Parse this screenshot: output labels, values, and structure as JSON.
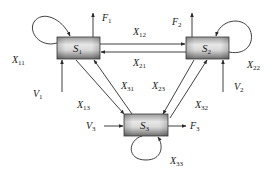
{
  "diagram": {
    "type": "flow-network",
    "nodes": [
      {
        "id": "S1",
        "label": "S",
        "sub": "1"
      },
      {
        "id": "S2",
        "label": "S",
        "sub": "2"
      },
      {
        "id": "S3",
        "label": "S",
        "sub": "3"
      }
    ],
    "edges": [
      {
        "id": "X11",
        "label": "X",
        "sub": "11",
        "from": "S1",
        "to": "S1"
      },
      {
        "id": "X22",
        "label": "X",
        "sub": "22",
        "from": "S2",
        "to": "S2"
      },
      {
        "id": "X33",
        "label": "X",
        "sub": "33",
        "from": "S3",
        "to": "S3"
      },
      {
        "id": "X12",
        "label": "X",
        "sub": "12",
        "from": "S1",
        "to": "S2"
      },
      {
        "id": "X21",
        "label": "X",
        "sub": "21",
        "from": "S2",
        "to": "S1"
      },
      {
        "id": "X13",
        "label": "X",
        "sub": "13",
        "from": "S1",
        "to": "S3"
      },
      {
        "id": "X31",
        "label": "X",
        "sub": "31",
        "from": "S3",
        "to": "S1"
      },
      {
        "id": "X23",
        "label": "X",
        "sub": "23",
        "from": "S2",
        "to": "S3"
      },
      {
        "id": "X32",
        "label": "X",
        "sub": "32",
        "from": "S3",
        "to": "S2"
      }
    ],
    "inputs": [
      {
        "id": "V1",
        "label": "V",
        "sub": "1",
        "to": "S1"
      },
      {
        "id": "V2",
        "label": "V",
        "sub": "2",
        "to": "S2"
      },
      {
        "id": "V3",
        "label": "V",
        "sub": "3",
        "to": "S3"
      }
    ],
    "outputs": [
      {
        "id": "F1",
        "label": "F",
        "sub": "1",
        "from": "S1"
      },
      {
        "id": "F2",
        "label": "F",
        "sub": "2",
        "from": "S2"
      },
      {
        "id": "F3",
        "label": "F",
        "sub": "3",
        "from": "S3"
      }
    ],
    "colors": {
      "box_light": "#e6e6e6",
      "box_dark": "#7a7a7a",
      "line": "#2a2a2a"
    }
  }
}
